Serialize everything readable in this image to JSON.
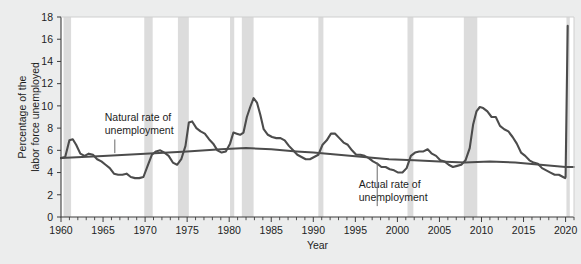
{
  "chart_data": {
    "type": "line",
    "title": "",
    "xlabel": "Year",
    "ylabel": "Percentage of the labor force unemployed",
    "xlim": [
      1960,
      2021
    ],
    "ylim": [
      0,
      18
    ],
    "ytick_step": 2,
    "xtick_step": 5,
    "xminor_step": 1,
    "grid": false,
    "legend": "none",
    "yticks": [
      "0",
      "2",
      "4",
      "6",
      "8",
      "10",
      "12",
      "14",
      "16",
      "18"
    ],
    "xticks": [
      "1960",
      "1965",
      "1970",
      "1975",
      "1980",
      "1985",
      "1990",
      "1995",
      "2000",
      "2005",
      "2010",
      "2015",
      "2020"
    ],
    "annotations": [
      {
        "id": "natural-rate",
        "text_line1": "Natural rate of",
        "text_line2": "unemployment",
        "x": 1965.2,
        "y": 8.6,
        "leader_to_x": 1966.4,
        "leader_to_y": 5.75
      },
      {
        "id": "actual-rate",
        "text_line1": "Actual rate of",
        "text_line2": "unemployment",
        "x": 1995.4,
        "y": 2.6,
        "leader_to_x": 1997.6,
        "leader_to_y": 4.9
      }
    ],
    "recessions": [
      {
        "start": 1960.3,
        "end": 1961.2
      },
      {
        "start": 1969.9,
        "end": 1970.9
      },
      {
        "start": 1973.9,
        "end": 1975.2
      },
      {
        "start": 1980.1,
        "end": 1980.6
      },
      {
        "start": 1981.5,
        "end": 1982.9
      },
      {
        "start": 1990.6,
        "end": 1991.2
      },
      {
        "start": 2001.2,
        "end": 2001.9
      },
      {
        "start": 2007.9,
        "end": 2009.5
      },
      {
        "start": 2020.1,
        "end": 2020.5
      }
    ],
    "colors": {
      "actual_line": "#4c4c4c",
      "natural_line": "#4c4c4c",
      "recession_band": "#dcdcdc",
      "plot_background": "#ffffff",
      "figure_background": "#eceded",
      "axis": "#3c3c3c",
      "text": "#1d1d1d"
    },
    "series": [
      {
        "name": "Actual rate of unemployment",
        "x": [
          1960.0,
          1960.5,
          1961.0,
          1961.4,
          1961.8,
          1962.3,
          1962.8,
          1963.3,
          1963.8,
          1964.3,
          1964.8,
          1965.3,
          1965.8,
          1966.3,
          1966.8,
          1967.3,
          1967.8,
          1968.3,
          1968.8,
          1969.3,
          1969.8,
          1970.3,
          1970.8,
          1971.3,
          1971.8,
          1972.3,
          1972.8,
          1973.3,
          1973.8,
          1974.3,
          1974.8,
          1975.2,
          1975.6,
          1976.1,
          1976.6,
          1977.1,
          1977.6,
          1978.1,
          1978.6,
          1979.1,
          1979.6,
          1980.1,
          1980.5,
          1980.9,
          1981.3,
          1981.7,
          1982.1,
          1982.5,
          1982.9,
          1983.3,
          1983.7,
          1984.1,
          1984.6,
          1985.1,
          1985.6,
          1986.1,
          1986.6,
          1987.1,
          1987.6,
          1988.1,
          1988.6,
          1989.1,
          1989.6,
          1990.1,
          1990.6,
          1991.1,
          1991.6,
          1992.1,
          1992.6,
          1993.1,
          1993.6,
          1994.1,
          1994.6,
          1995.1,
          1995.6,
          1996.1,
          1996.6,
          1997.1,
          1997.6,
          1998.1,
          1998.6,
          1999.1,
          1999.6,
          2000.1,
          2000.6,
          2001.1,
          2001.6,
          2002.1,
          2002.6,
          2003.1,
          2003.6,
          2004.1,
          2004.6,
          2005.1,
          2005.6,
          2006.1,
          2006.6,
          2007.1,
          2007.6,
          2008.1,
          2008.6,
          2009.0,
          2009.4,
          2009.8,
          2010.2,
          2010.7,
          2011.2,
          2011.7,
          2012.2,
          2012.7,
          2013.2,
          2013.7,
          2014.2,
          2014.7,
          2015.2,
          2015.7,
          2016.2,
          2016.7,
          2017.2,
          2017.7,
          2018.2,
          2018.7,
          2019.2,
          2019.7,
          2019.95,
          2020.0,
          2020.25
        ],
        "values": [
          5.3,
          5.4,
          6.9,
          7.0,
          6.5,
          5.7,
          5.5,
          5.7,
          5.6,
          5.2,
          5.0,
          4.7,
          4.4,
          3.9,
          3.8,
          3.8,
          3.9,
          3.6,
          3.5,
          3.5,
          3.6,
          4.6,
          5.6,
          5.9,
          6.0,
          5.8,
          5.5,
          4.9,
          4.7,
          5.2,
          6.4,
          8.5,
          8.6,
          8.0,
          7.7,
          7.5,
          7.0,
          6.6,
          6.0,
          5.8,
          5.9,
          6.6,
          7.6,
          7.5,
          7.4,
          7.6,
          9.0,
          9.9,
          10.7,
          10.3,
          9.2,
          7.9,
          7.4,
          7.2,
          7.1,
          7.1,
          6.9,
          6.4,
          6.0,
          5.6,
          5.4,
          5.2,
          5.2,
          5.4,
          5.6,
          6.5,
          6.9,
          7.5,
          7.5,
          7.1,
          6.7,
          6.5,
          6.0,
          5.6,
          5.6,
          5.5,
          5.3,
          5.0,
          4.8,
          4.5,
          4.5,
          4.3,
          4.2,
          4.0,
          4.0,
          4.4,
          5.5,
          5.8,
          5.9,
          5.9,
          6.1,
          5.7,
          5.5,
          5.1,
          5.0,
          4.7,
          4.5,
          4.6,
          4.7,
          5.1,
          6.2,
          8.3,
          9.5,
          9.9,
          9.8,
          9.5,
          9.0,
          9.0,
          8.2,
          7.9,
          7.7,
          7.2,
          6.6,
          5.8,
          5.5,
          5.1,
          4.9,
          4.8,
          4.4,
          4.2,
          4.0,
          3.8,
          3.8,
          3.6,
          3.5,
          3.6,
          17.2
        ]
      },
      {
        "name": "Natural rate of unemployment",
        "x": [
          1960,
          1965,
          1970,
          1975,
          1979,
          1982,
          1985,
          1988,
          1990,
          1993,
          1996,
          1999,
          2002,
          2005,
          2008,
          2011,
          2014,
          2017,
          2020,
          2021
        ],
        "values": [
          5.3,
          5.5,
          5.7,
          5.9,
          6.1,
          6.2,
          6.1,
          5.9,
          5.8,
          5.6,
          5.4,
          5.2,
          5.1,
          5.0,
          4.9,
          5.0,
          4.9,
          4.7,
          4.5,
          4.5
        ]
      }
    ]
  }
}
